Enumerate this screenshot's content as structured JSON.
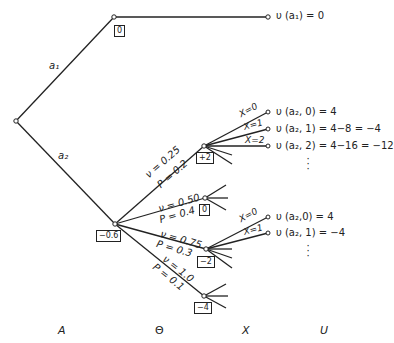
{
  "diagram": {
    "type": "decision-tree",
    "root": {
      "label": ""
    },
    "actions": [
      {
        "id": "a1",
        "label": "a₁",
        "value_box": "0",
        "utility": "υ (a₁) = 0"
      },
      {
        "id": "a2",
        "label": "a₂",
        "value_box": "−0.6"
      }
    ],
    "states": [
      {
        "nu": "ν = 0.25",
        "p": "P = 0.2",
        "value_box": "+2",
        "outcomes": [
          {
            "x": "X=0",
            "utility": "υ (a₂, 0) = 4"
          },
          {
            "x": "X=1",
            "utility": "υ (a₂, 1) = 4−8 = −4"
          },
          {
            "x": "X=2",
            "utility": "υ (a₂, 2) = 4−16 = −12"
          }
        ]
      },
      {
        "nu": "ν = 0.50",
        "p": "P = 0.4",
        "value_box": "0",
        "outcomes": []
      },
      {
        "nu": "ν = 0.75",
        "p": "P = 0.3",
        "value_box": "−2",
        "outcomes": [
          {
            "x": "X=0",
            "utility": "υ (a₂,0) = 4"
          },
          {
            "x": "X=1",
            "utility": "υ (a₂, 1) = −4"
          }
        ]
      },
      {
        "nu": "ν = 1.0",
        "p": "P = 0.1",
        "value_box": "−4",
        "outcomes": []
      }
    ],
    "ellipsis": "⋮",
    "axis_labels": [
      "A",
      "Θ",
      "X",
      "U"
    ]
  }
}
